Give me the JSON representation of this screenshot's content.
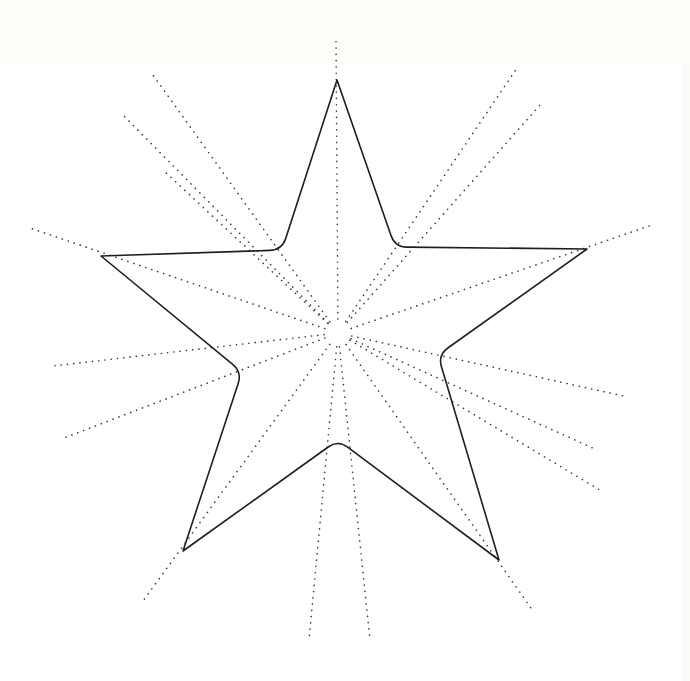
{
  "diagram": {
    "type": "five-pointed star with dotted radiating lines",
    "canvas": {
      "width": 690,
      "height": 681,
      "background": "#ffffff"
    },
    "colors": {
      "outline": "#1e1e1e",
      "dots": "#3a3a3a"
    },
    "center": [
      338,
      333
    ],
    "star": {
      "outer_tips": {
        "top": [
          337,
          80
        ],
        "upper_right": [
          587,
          249
        ],
        "lower_right": [
          499,
          560
        ],
        "lower_left": [
          183,
          551
        ],
        "upper_left": [
          101,
          256
        ]
      },
      "inner_vertices_rounded": {
        "upper_right": [
          395,
          247
        ],
        "right": [
          438,
          355
        ],
        "bottom": [
          338,
          440
        ],
        "left": [
          242,
          372
        ],
        "upper_left": [
          282,
          250
        ]
      }
    },
    "rays": [
      {
        "id": "ray-top",
        "end": [
          336,
          40
        ]
      },
      {
        "id": "ray-upper-left-1",
        "end": [
          153,
          75
        ]
      },
      {
        "id": "ray-upper-left-2",
        "end": [
          123,
          115
        ]
      },
      {
        "id": "ray-upper-left-3",
        "end": [
          163,
          170
        ]
      },
      {
        "id": "ray-upper-right-1",
        "end": [
          517,
          68
        ]
      },
      {
        "id": "ray-upper-right-2",
        "end": [
          540,
          105
        ]
      },
      {
        "id": "ray-left-top",
        "end": [
          30,
          228
        ]
      },
      {
        "id": "ray-left-mid",
        "end": [
          53,
          366
        ]
      },
      {
        "id": "ray-left-low",
        "end": [
          64,
          438
        ]
      },
      {
        "id": "ray-right-top",
        "end": [
          652,
          225
        ]
      },
      {
        "id": "ray-right-mid",
        "end": [
          628,
          397
        ]
      },
      {
        "id": "ray-right-low-1",
        "end": [
          597,
          450
        ]
      },
      {
        "id": "ray-right-low-2",
        "end": [
          603,
          492
        ]
      },
      {
        "id": "ray-lower-left",
        "end": [
          143,
          601
        ]
      },
      {
        "id": "ray-lower-right",
        "end": [
          533,
          611
        ]
      },
      {
        "id": "ray-bottom-left",
        "end": [
          309,
          640
        ]
      },
      {
        "id": "ray-bottom-right",
        "end": [
          370,
          640
        ]
      }
    ]
  }
}
